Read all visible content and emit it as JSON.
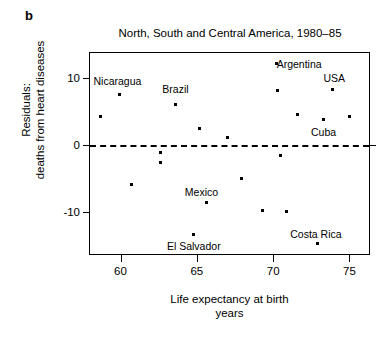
{
  "figure": {
    "panel_letter": "b",
    "title": "North, South and Central America, 1980–85",
    "xaxis_title_line1": "Life expectancy at birth",
    "xaxis_title_line2": "years",
    "yaxis_title_line1": "Residuals:",
    "yaxis_title_line2": "deaths from heart diseases"
  },
  "chart_data": {
    "type": "scatter",
    "title": "North, South and Central America, 1980–85",
    "xlabel": "Life expectancy at birth years",
    "ylabel": "Residuals: deaths from heart diseases",
    "xlim": [
      58.0,
      76.2
    ],
    "ylim": [
      -16.2,
      13.8
    ],
    "xticks": [
      60,
      65,
      70,
      75
    ],
    "xtick_labels": [
      "60",
      "65",
      "70",
      "75"
    ],
    "yticks": [
      10,
      0,
      -10
    ],
    "ytick_labels": [
      "10",
      "0",
      "-10"
    ],
    "grid": false,
    "legend": null,
    "reference_line": {
      "y": 0,
      "style": "dashed"
    },
    "points": [
      {
        "label": "",
        "x": 58.7,
        "y": 4.3
      },
      {
        "label": "Nicaragua",
        "x": 59.9,
        "y": 7.6
      },
      {
        "label": "",
        "x": 60.7,
        "y": -5.9
      },
      {
        "label": "",
        "x": 62.6,
        "y": -1.1
      },
      {
        "label": "",
        "x": 62.6,
        "y": -2.7
      },
      {
        "label": "Brazil",
        "x": 63.6,
        "y": 6.0
      },
      {
        "label": "El Salvador",
        "x": 64.8,
        "y": -13.5
      },
      {
        "label": "",
        "x": 65.2,
        "y": 2.4
      },
      {
        "label": "Mexico",
        "x": 65.6,
        "y": -8.6
      },
      {
        "label": "",
        "x": 67.0,
        "y": 1.1
      },
      {
        "label": "",
        "x": 67.9,
        "y": -5.1
      },
      {
        "label": "",
        "x": 69.3,
        "y": -9.8
      },
      {
        "label": "Argentina",
        "x": 70.2,
        "y": 12.2
      },
      {
        "label": "",
        "x": 70.3,
        "y": 8.2
      },
      {
        "label": "",
        "x": 70.5,
        "y": -1.6
      },
      {
        "label": "",
        "x": 70.9,
        "y": -10.0
      },
      {
        "label": "",
        "x": 71.6,
        "y": 4.6
      },
      {
        "label": "Costa Rica",
        "x": 72.9,
        "y": -14.8
      },
      {
        "label": "Cuba",
        "x": 73.3,
        "y": 3.8
      },
      {
        "label": "USA",
        "x": 73.9,
        "y": 8.3
      },
      {
        "label": "",
        "x": 75.0,
        "y": 4.3
      }
    ],
    "annotations": [
      {
        "text": "Nicaragua",
        "x": 59.8,
        "y": 9.6
      },
      {
        "text": "Brazil",
        "x": 63.6,
        "y": 8.4
      },
      {
        "text": "Argentina",
        "x": 71.7,
        "y": 12.1
      },
      {
        "text": "USA",
        "x": 74.0,
        "y": 10.1
      },
      {
        "text": "Cuba",
        "x": 73.3,
        "y": 1.9
      },
      {
        "text": "Mexico",
        "x": 65.3,
        "y": -7.0
      },
      {
        "text": "El Salvador",
        "x": 64.8,
        "y": -15.2
      },
      {
        "text": "Costa Rica",
        "x": 72.8,
        "y": -13.4
      }
    ]
  }
}
